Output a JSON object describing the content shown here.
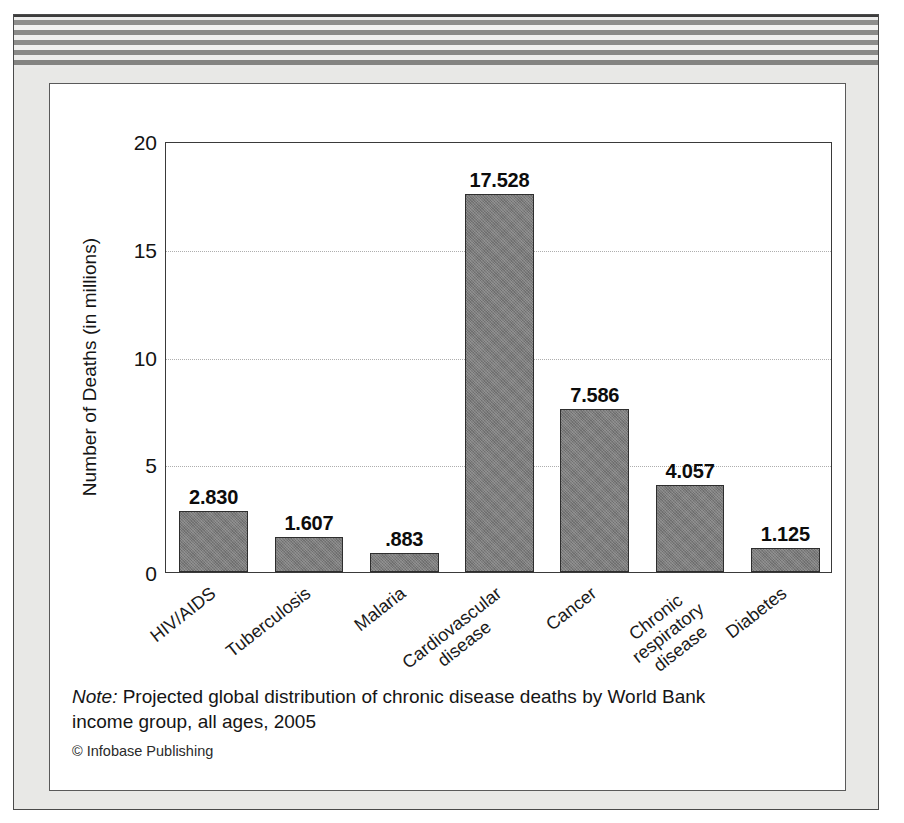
{
  "figure": {
    "background_color": "#e8e8e6",
    "panel_color": "#ffffff",
    "bar_color": "#7b7b7b",
    "axis_color": "#3a3a3a",
    "note_lead": "Note:",
    "note_body": " Projected global distribution of chronic disease deaths by World Bank income group, all ages, 2005",
    "credit": "© Infobase Publishing"
  },
  "chart_data": {
    "type": "bar",
    "title": "",
    "xlabel": "",
    "ylabel": "Number of Deaths (in millions)",
    "ylim": [
      0,
      20
    ],
    "yticks": [
      "0",
      "5",
      "10",
      "15",
      "20"
    ],
    "ytick_values": [
      0,
      5,
      10,
      15,
      20
    ],
    "grid": "horizontal-dotted",
    "legend": "none",
    "categories": [
      "HIV/AIDS",
      "Tuberculosis",
      "Malaria",
      "Cardiovascular disease",
      "Cancer",
      "Chronic respiratory disease",
      "Diabetes"
    ],
    "values": [
      2.83,
      1.607,
      0.883,
      17.528,
      7.586,
      4.057,
      1.125
    ],
    "value_labels": [
      "2.830",
      "1.607",
      ".883",
      "17.528",
      "7.586",
      "4.057",
      "1.125"
    ],
    "category_label_lines": [
      [
        "HIV/AIDS"
      ],
      [
        "Tuberculosis"
      ],
      [
        "Malaria"
      ],
      [
        "Cardiovascular",
        "disease"
      ],
      [
        "Cancer"
      ],
      [
        "Chronic",
        "respiratory",
        "disease"
      ],
      [
        "Diabetes"
      ]
    ]
  }
}
